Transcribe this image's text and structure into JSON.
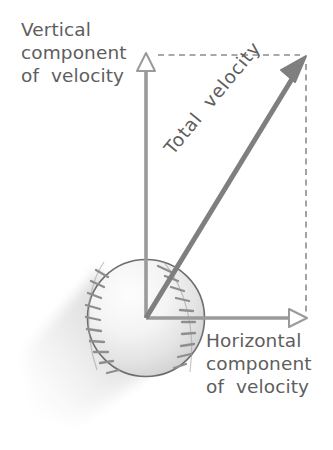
{
  "diagram": {
    "background_color": "#ffffff",
    "labels": {
      "vertical": "Vertical\ncomponent\nof  velocity",
      "horizontal": "Horizontal\ncomponent\nof  velocity",
      "total": "Total  velocity"
    },
    "colors": {
      "text": "#5e5e5e",
      "axis_arrow": "#9a9a9a",
      "total_arrow": "#7f7f7f",
      "dashed_guide": "#8c8c8c",
      "ball_outline": "#6e6e6e",
      "ball_seam": "#8e8e8e",
      "ball_fill_light": "#fbfbfb",
      "ball_fill_shade": "#d6d6d6",
      "motion_blur": "#e2e2e2"
    },
    "geometry": {
      "origin": [
        146,
        318
      ],
      "vertical_tip": [
        146,
        56
      ],
      "horizontal_tip": [
        305,
        318
      ],
      "total_tip": [
        305,
        58
      ],
      "ball_center": [
        146,
        318
      ],
      "ball_radius": 59
    },
    "vectors": [
      {
        "name": "vertical-component",
        "label": "Vertical component of velocity",
        "head_style": "open",
        "from": [
          146,
          318
        ],
        "to": [
          146,
          56
        ]
      },
      {
        "name": "horizontal-component",
        "label": "Horizontal component of velocity",
        "head_style": "open",
        "from": [
          146,
          318
        ],
        "to": [
          305,
          318
        ]
      },
      {
        "name": "total-velocity",
        "label": "Total velocity",
        "head_style": "filled",
        "from": [
          146,
          318
        ],
        "to": [
          305,
          58
        ]
      }
    ],
    "guides": [
      {
        "name": "top-dashed-guide",
        "from": [
          158,
          55
        ],
        "to": [
          302,
          55
        ]
      },
      {
        "name": "right-dashed-guide",
        "from": [
          306,
          62
        ],
        "to": [
          306,
          316
        ]
      }
    ]
  }
}
